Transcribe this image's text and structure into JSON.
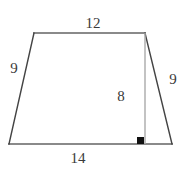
{
  "figure": {
    "type": "trapezoid-with-height",
    "canvas": {
      "width": 190,
      "height": 169,
      "background": "#ffffff"
    },
    "colors": {
      "horizontal_edge": "#8a8a8a",
      "slanted_edge": "#444444",
      "height_line": "#aaaaaa",
      "right_angle_marker": "#111111",
      "label_text": "#3a3a3a"
    },
    "vertices": {
      "top_left": {
        "x": 34,
        "y": 33
      },
      "top_right": {
        "x": 145,
        "y": 33
      },
      "bottom_right": {
        "x": 172,
        "y": 144
      },
      "bottom_left": {
        "x": 9,
        "y": 144
      }
    },
    "height_segment": {
      "from": {
        "x": 145,
        "y": 33
      },
      "to": {
        "x": 145,
        "y": 144
      }
    },
    "right_angle_marker": {
      "x": 137,
      "y": 137,
      "size": 7
    },
    "labels": {
      "top": "12",
      "left": "9",
      "right": "9",
      "height": "8",
      "bottom": "14"
    }
  }
}
